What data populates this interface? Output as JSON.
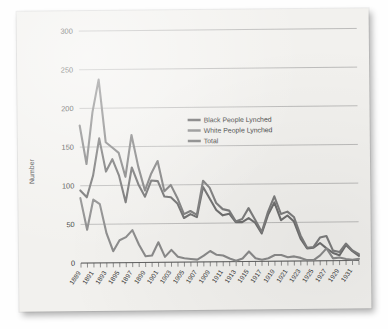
{
  "figure": {
    "card_background": "#f2f1ee",
    "ylabel": "Number"
  },
  "legend": {
    "items": [
      {
        "label": "Black People Lynched",
        "color": "#6f6f6f"
      },
      {
        "label": "White People Lynched",
        "color": "#8a8a8a"
      },
      {
        "label": "Total",
        "color": "#7d7d7d"
      }
    ]
  },
  "chart_data": {
    "type": "line",
    "title": "",
    "xlabel": "",
    "ylabel": "Number",
    "ylim": [
      0,
      300
    ],
    "yticks": [
      0,
      50,
      100,
      150,
      200,
      250,
      300
    ],
    "ytick_labels": [
      "0",
      "50",
      "100",
      "150",
      "200",
      "250",
      "300"
    ],
    "xlim": [
      1889,
      1932
    ],
    "grid": true,
    "legend_position": "upper-center",
    "x": [
      1889,
      1890,
      1891,
      1892,
      1893,
      1894,
      1895,
      1896,
      1897,
      1898,
      1899,
      1900,
      1901,
      1902,
      1903,
      1904,
      1905,
      1906,
      1907,
      1908,
      1909,
      1910,
      1911,
      1912,
      1913,
      1914,
      1915,
      1916,
      1917,
      1918,
      1919,
      1920,
      1921,
      1922,
      1923,
      1924,
      1925,
      1926,
      1927,
      1928,
      1929,
      1930,
      1931,
      1932
    ],
    "xtick_labels": [
      "1889",
      "1891",
      "1893",
      "1895",
      "1897",
      "1899",
      "1901",
      "1903",
      "1905",
      "1907",
      "1909",
      "1911",
      "1913",
      "1915",
      "1917",
      "1919",
      "1921",
      "1923",
      "1925",
      "1927",
      "1929",
      "1931"
    ],
    "series": [
      {
        "name": "Black People Lynched",
        "color": "#6f6f6f",
        "values": [
          94,
          85,
          113,
          161,
          118,
          134,
          113,
          78,
          123,
          101,
          85,
          106,
          105,
          85,
          84,
          76,
          57,
          62,
          58,
          97,
          82,
          67,
          60,
          62,
          51,
          51,
          56,
          50,
          36,
          60,
          76,
          53,
          59,
          51,
          29,
          16,
          17,
          23,
          16,
          10,
          7,
          20,
          12,
          6
        ]
      },
      {
        "name": "White People Lynched",
        "color": "#8a8a8a",
        "values": [
          84,
          43,
          82,
          76,
          38,
          15,
          29,
          33,
          42,
          23,
          8,
          9,
          26,
          7,
          16,
          7,
          5,
          4,
          3,
          8,
          14,
          9,
          8,
          4,
          1,
          4,
          13,
          4,
          2,
          4,
          8,
          8,
          5,
          6,
          4,
          1,
          1,
          7,
          16,
          3,
          4,
          2,
          1,
          2
        ]
      },
      {
        "name": "Total",
        "color": "#7d7d7d",
        "values": [
          178,
          128,
          195,
          237,
          156,
          149,
          142,
          111,
          165,
          124,
          93,
          115,
          131,
          92,
          100,
          83,
          62,
          66,
          61,
          105,
          96,
          76,
          68,
          66,
          52,
          55,
          69,
          54,
          38,
          64,
          84,
          61,
          64,
          57,
          33,
          17,
          18,
          30,
          32,
          13,
          11,
          22,
          13,
          8
        ]
      }
    ]
  }
}
